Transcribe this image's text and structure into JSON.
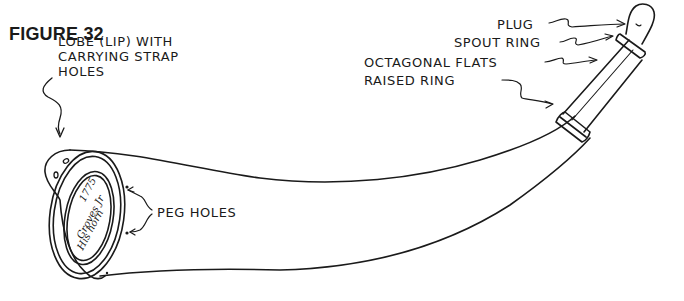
{
  "figure": {
    "title": "FIGURE 32"
  },
  "labels": {
    "lobe": [
      "LOBE (LIP) WITH",
      "CARRYING STRAP",
      "HOLES"
    ],
    "plug": "PLUG",
    "spout_ring": "SPOUT RING",
    "octagonal_flats": "OCTAGONAL FLATS",
    "raised_ring": "RAISED RING",
    "peg_holes": "PEG HOLES"
  },
  "inscription": {
    "lines": [
      "1775",
      "Groves Jr",
      "His horn"
    ]
  },
  "colors": {
    "ink": "#1a1a1a",
    "background": "#ffffff"
  }
}
